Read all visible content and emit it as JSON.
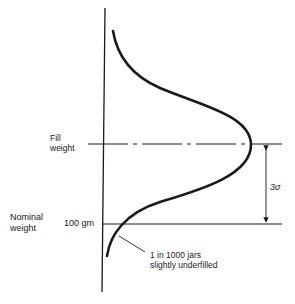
{
  "diagram": {
    "type": "normal-distribution-fill-weight",
    "labels": {
      "fill_weight": [
        "Fill",
        "weight"
      ],
      "nominal_weight": [
        "Nominal",
        "weight"
      ],
      "nominal_value": "100 gm",
      "spread": "3σ",
      "annotation": [
        "1 in 1000 jars",
        "slightly underfilled"
      ]
    },
    "colors": {
      "line": "#1a1a1a",
      "background": "#ffffff"
    }
  }
}
